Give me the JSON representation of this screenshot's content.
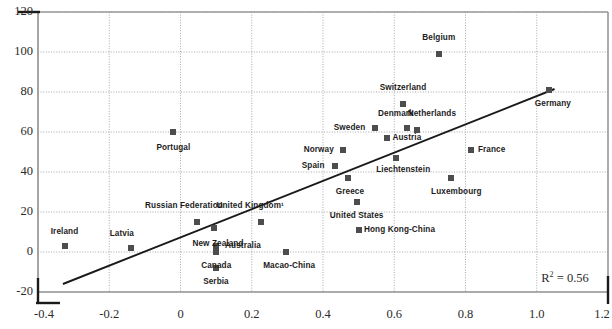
{
  "chart_data": {
    "type": "scatter",
    "title": "",
    "xlabel": "",
    "ylabel": "",
    "xlim": [
      -0.4,
      1.2
    ],
    "ylim": [
      -20,
      120
    ],
    "xticks": [
      "-0.4",
      "-0.2",
      "0",
      "0.2",
      "0.4",
      "0.6",
      "0.8",
      "1.0",
      "1.2"
    ],
    "xtick_values": [
      -0.4,
      -0.2,
      0,
      0.2,
      0.4,
      0.6,
      0.8,
      1.0,
      1.2
    ],
    "yticks": [
      "-20",
      "0",
      "20",
      "40",
      "60",
      "80",
      "100",
      "120"
    ],
    "ytick_values": [
      -20,
      0,
      20,
      40,
      60,
      80,
      100,
      120
    ],
    "grid": true,
    "legend": null,
    "annotations": [
      {
        "name": "r2-annotation",
        "text_prefix": "R",
        "text_sup": "2",
        "text_suffix": "= 0.56",
        "x": 1.08,
        "y": -13
      }
    ],
    "trendline": {
      "x0": -0.33,
      "y0": -16.0,
      "x1": 1.05,
      "y1": 81.5,
      "color": "#1a1a1a"
    },
    "marker_color": "#4d4d4d",
    "points": [
      {
        "label": "Ireland",
        "x": -0.325,
        "y": 3,
        "lx": -0.325,
        "ly": 10,
        "anchor": "center"
      },
      {
        "label": "Latvia",
        "x": -0.14,
        "y": 2,
        "lx": -0.165,
        "ly": 9,
        "anchor": "center"
      },
      {
        "label": "Portugal",
        "x": -0.02,
        "y": 60,
        "lx": -0.02,
        "ly": 52,
        "anchor": "center"
      },
      {
        "label": "Russian Federation",
        "x": 0.045,
        "y": 15,
        "lx": 0.01,
        "ly": 23,
        "anchor": "center"
      },
      {
        "label": "Canada",
        "x": 0.1,
        "y": 0,
        "lx": 0.1,
        "ly": -7,
        "anchor": "center"
      },
      {
        "label": "New Zealand",
        "x": 0.095,
        "y": 12,
        "lx": 0.105,
        "ly": 4,
        "anchor": "center"
      },
      {
        "label": "Australia",
        "x": 0.1,
        "y": 3,
        "lx": 0.125,
        "ly": 3,
        "anchor": "left"
      },
      {
        "label": "Serbia",
        "x": 0.1,
        "y": -8,
        "lx": 0.1,
        "ly": -15,
        "anchor": "center"
      },
      {
        "label": "United Kingdom¹",
        "x": 0.225,
        "y": 15,
        "lx": 0.195,
        "ly": 23,
        "anchor": "center"
      },
      {
        "label": "Macao-China",
        "x": 0.295,
        "y": 0,
        "lx": 0.305,
        "ly": -7,
        "anchor": "center"
      },
      {
        "label": "Spain",
        "x": 0.435,
        "y": 43,
        "lx": 0.405,
        "ly": 43,
        "anchor": "right"
      },
      {
        "label": "Norway",
        "x": 0.455,
        "y": 51,
        "lx": 0.43,
        "ly": 51,
        "anchor": "right"
      },
      {
        "label": "Greece",
        "x": 0.47,
        "y": 37,
        "lx": 0.475,
        "ly": 30,
        "anchor": "center"
      },
      {
        "label": "United States",
        "x": 0.495,
        "y": 25,
        "lx": 0.495,
        "ly": 18,
        "anchor": "center"
      },
      {
        "label": "Hong Kong-China",
        "x": 0.5,
        "y": 11,
        "lx": 0.515,
        "ly": 11,
        "anchor": "left"
      },
      {
        "label": "Sweden",
        "x": 0.545,
        "y": 62,
        "lx": 0.52,
        "ly": 62,
        "anchor": "right"
      },
      {
        "label": "Austria",
        "x": 0.58,
        "y": 57,
        "lx": 0.595,
        "ly": 57,
        "anchor": "left"
      },
      {
        "label": "Liechtenstein",
        "x": 0.605,
        "y": 47,
        "lx": 0.625,
        "ly": 41,
        "anchor": "center"
      },
      {
        "label": "Denmark",
        "x": 0.635,
        "y": 62,
        "lx": 0.605,
        "ly": 69,
        "anchor": "center"
      },
      {
        "label": "Switzerland",
        "x": 0.625,
        "y": 74,
        "lx": 0.625,
        "ly": 82,
        "anchor": "center"
      },
      {
        "label": "Netherlands",
        "x": 0.665,
        "y": 61,
        "lx": 0.705,
        "ly": 69,
        "anchor": "center"
      },
      {
        "label": "Belgium",
        "x": 0.725,
        "y": 99,
        "lx": 0.725,
        "ly": 107,
        "anchor": "center"
      },
      {
        "label": "Luxembourg",
        "x": 0.76,
        "y": 37,
        "lx": 0.775,
        "ly": 30,
        "anchor": "center"
      },
      {
        "label": "France",
        "x": 0.815,
        "y": 51,
        "lx": 0.835,
        "ly": 51,
        "anchor": "left"
      },
      {
        "label": "Germany",
        "x": 1.035,
        "y": 81,
        "lx": 1.045,
        "ly": 74,
        "anchor": "center"
      }
    ]
  }
}
